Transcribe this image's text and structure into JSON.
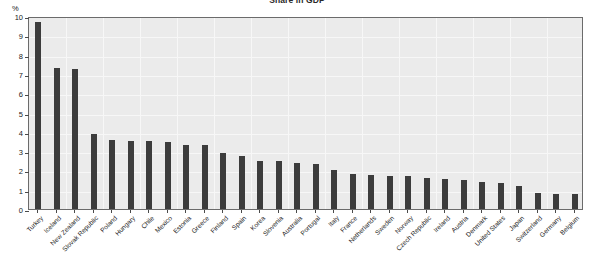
{
  "chart_data": {
    "type": "bar",
    "title": "Share in GDP",
    "xlabel": "",
    "ylabel": "%",
    "ylim": [
      0,
      10
    ],
    "ytick_labels": [
      "0",
      "1",
      "2",
      "3",
      "4",
      "5",
      "6",
      "7",
      "8",
      "9",
      "10"
    ],
    "grid": true,
    "legend": "none",
    "orientation": "vertical",
    "bar_color": "#3c3c3c",
    "plot_background": "#ebebeb",
    "categories": [
      "Turkey",
      "Iceland",
      "New Zealand",
      "Slovak Republic",
      "Poland",
      "Hungary",
      "Chile",
      "Mexico",
      "Estonia",
      "Greece",
      "Finland",
      "Spain",
      "Korea",
      "Slovenia",
      "Australia",
      "Portugal",
      "Italy",
      "France",
      "Netherlands",
      "Sweden",
      "Norway",
      "Czech Republic",
      "Ireland",
      "Austria",
      "Denmark",
      "United States",
      "Japan",
      "Switzerland",
      "Germany",
      "Belgium"
    ],
    "values": [
      9.7,
      7.3,
      7.25,
      3.9,
      3.6,
      3.5,
      3.55,
      3.45,
      3.3,
      3.3,
      2.9,
      2.75,
      2.5,
      2.5,
      2.4,
      2.35,
      2.0,
      1.8,
      1.75,
      1.7,
      1.7,
      1.6,
      1.55,
      1.5,
      1.4,
      1.35,
      1.2,
      0.85,
      0.8,
      0.8
    ]
  }
}
